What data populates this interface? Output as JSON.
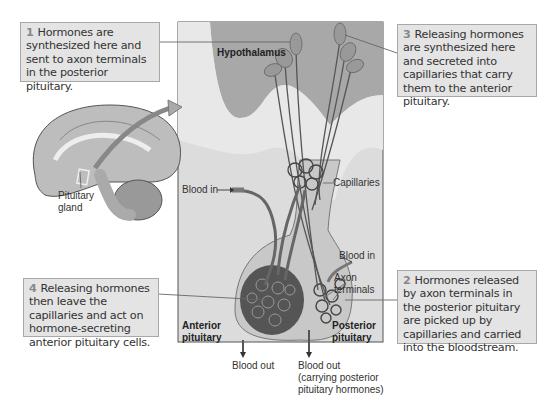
{
  "diagram": {
    "callouts": [
      {
        "num": "1",
        "text": "Hormones are synthesized here and sent to axon terminals in the posterior pituitary."
      },
      {
        "num": "2",
        "text": "Hormones released by axon terminals in the posterior pituitary are picked up by capillaries and carried into the bloodstream."
      },
      {
        "num": "3",
        "text": "Releasing hormones are synthesized here and secreted into capillaries that carry them to the anterior pituitary."
      },
      {
        "num": "4",
        "text": "Releasing hormones then leave the capillaries and act on hormone-secreting anterior pituitary cells."
      }
    ],
    "labels": {
      "hypothalamus": "Hypothalamus",
      "capillaries": "Capillaries",
      "blood_in_left": "Blood in",
      "blood_in_right": "Blood in",
      "axon_terminals_1": "Axon",
      "axon_terminals_2": "terminals",
      "anterior_1": "Anterior",
      "anterior_2": "pituitary",
      "posterior_1": "Posterior",
      "posterior_2": "pituitary",
      "blood_out_left": "Blood out",
      "blood_out_right_1": "Blood out",
      "blood_out_right_2": "(carrying posterior",
      "blood_out_right_3": "pituitary hormones)",
      "pituitary_gland_1": "Pituitary",
      "pituitary_gland_2": "gland"
    },
    "colors": {
      "panel_bg": "#d9d9d9",
      "hypothalamus_fill": "#a9a9a9",
      "callout_bg": "#e4e4e4",
      "gland_fill": "#c4c4c4",
      "capillary_dark": "#3a3a3a"
    }
  }
}
